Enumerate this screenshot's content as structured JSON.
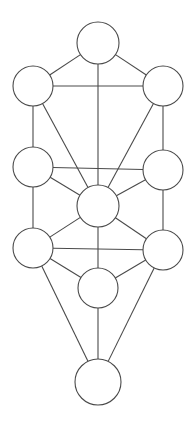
{
  "diagram": {
    "type": "node-link-graph",
    "canvas": {
      "width": 196,
      "height": 424,
      "background": "#ffffff"
    },
    "style": {
      "stroke_color": "#4a4a4a",
      "node_fill": "#ffffff",
      "stroke_width": 1.1
    },
    "nodes": [
      {
        "id": "n1",
        "label": "",
        "cx": 98,
        "cy": 43,
        "r": 21,
        "position": "top-center"
      },
      {
        "id": "n2",
        "label": "",
        "cx": 33,
        "cy": 86,
        "r": 20,
        "position": "upper-left"
      },
      {
        "id": "n3",
        "label": "",
        "cx": 163,
        "cy": 86,
        "r": 20,
        "position": "upper-right"
      },
      {
        "id": "n4",
        "label": "",
        "cx": 33,
        "cy": 167,
        "r": 20,
        "position": "middle-left"
      },
      {
        "id": "n5",
        "label": "",
        "cx": 163,
        "cy": 170,
        "r": 20,
        "position": "middle-right"
      },
      {
        "id": "n6",
        "label": "",
        "cx": 98,
        "cy": 206,
        "r": 21,
        "position": "center"
      },
      {
        "id": "n7",
        "label": "",
        "cx": 33,
        "cy": 248,
        "r": 20,
        "position": "lower-left"
      },
      {
        "id": "n8",
        "label": "",
        "cx": 163,
        "cy": 250,
        "r": 20,
        "position": "lower-right"
      },
      {
        "id": "n9",
        "label": "",
        "cx": 98,
        "cy": 288,
        "r": 20,
        "position": "lower-center"
      },
      {
        "id": "n10",
        "label": "",
        "cx": 98,
        "cy": 382,
        "r": 23,
        "position": "bottom-center"
      }
    ],
    "edges": [
      {
        "from": "n1",
        "to": "n2"
      },
      {
        "from": "n1",
        "to": "n3"
      },
      {
        "from": "n1",
        "to": "n6"
      },
      {
        "from": "n2",
        "to": "n3"
      },
      {
        "from": "n2",
        "to": "n4"
      },
      {
        "from": "n2",
        "to": "n6"
      },
      {
        "from": "n3",
        "to": "n5"
      },
      {
        "from": "n3",
        "to": "n6"
      },
      {
        "from": "n4",
        "to": "n5"
      },
      {
        "from": "n4",
        "to": "n6"
      },
      {
        "from": "n4",
        "to": "n7"
      },
      {
        "from": "n5",
        "to": "n6"
      },
      {
        "from": "n5",
        "to": "n8"
      },
      {
        "from": "n6",
        "to": "n7"
      },
      {
        "from": "n6",
        "to": "n8"
      },
      {
        "from": "n6",
        "to": "n9"
      },
      {
        "from": "n7",
        "to": "n8"
      },
      {
        "from": "n7",
        "to": "n9"
      },
      {
        "from": "n7",
        "to": "n10"
      },
      {
        "from": "n8",
        "to": "n9"
      },
      {
        "from": "n8",
        "to": "n10"
      },
      {
        "from": "n9",
        "to": "n10"
      }
    ]
  }
}
